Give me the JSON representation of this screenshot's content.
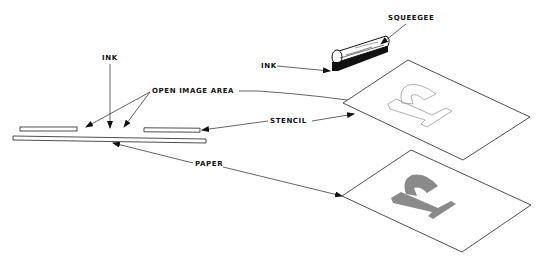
{
  "diagram": {
    "colors": {
      "line": "#222222",
      "ink": "#111111",
      "print_fill": "#8a8a8a",
      "stencil_outline": "#9a9a9a",
      "background": "#ffffff"
    },
    "labels": {
      "ink_top": "INK",
      "open_image_area": "OPEN  IMAGE  AREA",
      "stencil": "STENCIL",
      "paper": "PAPER",
      "squeegee": "SQUEEGEE",
      "ink_squeegee": "INK"
    },
    "components": [
      {
        "id": "cross-section",
        "parts": [
          "stencil-left",
          "stencil-right",
          "paper-strip",
          "open-gap"
        ]
      },
      {
        "id": "squeegee",
        "label": "SQUEEGEE"
      },
      {
        "id": "stencil-sheet",
        "label": "STENCIL",
        "contains": "open image area (letter outline)"
      },
      {
        "id": "paper-sheet",
        "label": "PAPER",
        "contains": "printed letter"
      }
    ]
  }
}
